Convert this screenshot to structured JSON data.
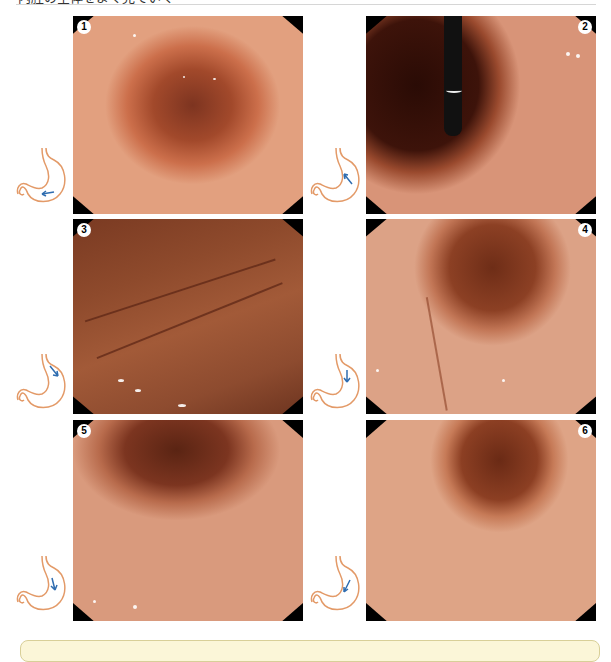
{
  "header": {
    "clipped_text": "内腔の全体をよく見ていく"
  },
  "figure": {
    "panels": [
      {
        "number": "1",
        "badge_side": "left",
        "view": "antrum-lumen",
        "arrow_direction": "left"
      },
      {
        "number": "2",
        "badge_side": "right",
        "view": "retroflex-with-scope",
        "arrow_direction": "up-left"
      },
      {
        "number": "3",
        "badge_side": "left",
        "view": "greater-curvature-folds",
        "arrow_direction": "down-right"
      },
      {
        "number": "4",
        "badge_side": "right",
        "view": "body-lumen-folds",
        "arrow_direction": "down"
      },
      {
        "number": "5",
        "badge_side": "left",
        "view": "lower-body",
        "arrow_direction": "down"
      },
      {
        "number": "6",
        "badge_side": "right",
        "view": "antrum-distal",
        "arrow_direction": "down-left"
      }
    ],
    "icons": {
      "stomach": "stomach-outline-icon",
      "arrow": "direction-arrow-icon"
    },
    "colors": {
      "mucosa": "#c9653f",
      "mucosa_light": "#e0a07a",
      "lumen_dark": "#5a1f10",
      "stomach_outline": "#e39a68",
      "arrow": "#2f6db0",
      "callout_fill": "#fbf6d8",
      "callout_border": "#d8cf98"
    }
  }
}
